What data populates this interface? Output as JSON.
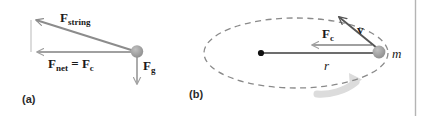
{
  "figure": {
    "background_color": "#ffffff",
    "divider_color": "#b4b4b4",
    "panels": [
      {
        "id": "a",
        "label": "(a)",
        "description": "Free body diagram of conical pendulum bob showing string tension, net centripetal force and weight",
        "vectors": [
          {
            "name": "F_string",
            "label_main": "F",
            "label_sub": "string",
            "color": "#8c8c8c",
            "direction": "up-left"
          },
          {
            "name": "F_net_equals_F_c",
            "label_main": "F",
            "label_sub": "net",
            "label_rest": " = ",
            "label_main2": "F",
            "label_sub2": "c",
            "color": "#8c8c8c",
            "direction": "left"
          },
          {
            "name": "F_g",
            "label_main": "F",
            "label_sub": "g",
            "color": "#9a9a9a",
            "direction": "down"
          }
        ],
        "ball": {
          "name": "mass-bob",
          "color": "#9e9e9e"
        }
      },
      {
        "id": "b",
        "label": "(b)",
        "description": "Top view of object in uniform circular motion showing radius, centripetal force, tangential velocity and direction of rotation",
        "orbit": {
          "style": "dashed",
          "color": "#8a8a8a"
        },
        "center_dot_color": "#111111",
        "vectors": [
          {
            "name": "F_c",
            "label_main": "F",
            "label_sub": "c",
            "color": "#9a9a9a",
            "direction": "left"
          },
          {
            "name": "v",
            "label_main": "v",
            "color": "#555555",
            "direction": "up-left"
          }
        ],
        "scalars": [
          {
            "name": "r",
            "label": "r"
          },
          {
            "name": "m",
            "label": "m"
          }
        ],
        "ball": {
          "name": "mass-ball",
          "color": "#9e9e9e"
        },
        "rotation_arrow": {
          "name": "rotation-direction-arrow",
          "color": "#d8d8d8"
        }
      }
    ]
  },
  "labels": {
    "f_string_main": "F",
    "f_string_sub": "string",
    "f_net_main": "F",
    "f_net_sub": "net",
    "equals": "=",
    "f_c_main": "F",
    "f_c_sub": "c",
    "f_g_main": "F",
    "f_g_sub": "g",
    "v_main": "v",
    "r_label": "r",
    "m_label": "m",
    "panel_a": "(a)",
    "panel_b": "(b)"
  }
}
